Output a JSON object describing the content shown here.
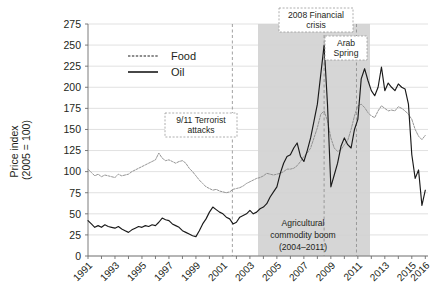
{
  "chart_data": {
    "type": "line",
    "title": "",
    "xlabel": "",
    "ylabel": "Price index\n(2005 = 100)",
    "ylabel_line1": "Price index",
    "ylabel_line2": "(2005 = 100)",
    "ylim": [
      0,
      275
    ],
    "yticks": [
      0,
      25,
      50,
      75,
      100,
      125,
      150,
      175,
      200,
      225,
      250,
      275
    ],
    "xlim": [
      1991,
      2016.2
    ],
    "xticks": [
      1991,
      1993,
      1995,
      1997,
      1999,
      2001,
      2003,
      2005,
      2007,
      2009,
      2011,
      2013,
      2015,
      2016
    ],
    "xticklabels": [
      "1991",
      "1993",
      "1995",
      "1997",
      "1999",
      "2001",
      "2003",
      "2005",
      "2007",
      "2009",
      "2011",
      "2013",
      "2015",
      "2016"
    ],
    "grid": true,
    "legend_position": "upper-left-inside",
    "legend": [
      {
        "name": "Food",
        "style": "dotted",
        "color": "#8e8e8e"
      },
      {
        "name": "Oil",
        "style": "solid",
        "color": "#1a1a1a"
      }
    ],
    "annotations": [
      {
        "label": "9/11 Terrorist\nattacks",
        "line1": "9/11 Terrorist",
        "line2": "attacks",
        "x": 2001.7,
        "boxed": true
      },
      {
        "label": "2008 Financial\ncrisis",
        "line1": "2008 Financial",
        "line2": "crisis",
        "x": 2008.5,
        "boxed": true
      },
      {
        "label": "Arab\nSpring",
        "line1": "Arab",
        "line2": "Spring",
        "x": 2010.9,
        "boxed": true
      },
      {
        "label": "Agricultural\ncommodity boom\n(2004–2011)",
        "line1": "Agricultural",
        "line2": "commodity boom",
        "line3": "(2004–2011)",
        "boxed": false
      }
    ],
    "shaded_region": {
      "label": "Agricultural commodity boom",
      "start": 2003.6,
      "end": 2011.9,
      "color": "#cfcfcf"
    },
    "vertical_markers": [
      2001.7,
      2008.5,
      2010.9
    ],
    "series": [
      {
        "name": "Food",
        "color": "#8e8e8e",
        "style": "dotted",
        "x": [
          1991.0,
          1991.25,
          1991.5,
          1991.75,
          1992.0,
          1992.25,
          1992.5,
          1992.75,
          1993.0,
          1993.25,
          1993.5,
          1993.75,
          1994.0,
          1994.25,
          1994.5,
          1994.75,
          1995.0,
          1995.25,
          1995.5,
          1995.75,
          1996.0,
          1996.25,
          1996.5,
          1996.75,
          1997.0,
          1997.25,
          1997.5,
          1997.75,
          1998.0,
          1998.25,
          1998.5,
          1998.75,
          1999.0,
          1999.25,
          1999.5,
          1999.75,
          2000.0,
          2000.25,
          2000.5,
          2000.75,
          2001.0,
          2001.25,
          2001.5,
          2001.75,
          2002.0,
          2002.25,
          2002.5,
          2002.75,
          2003.0,
          2003.25,
          2003.5,
          2003.75,
          2004.0,
          2004.25,
          2004.5,
          2004.75,
          2005.0,
          2005.25,
          2005.5,
          2005.75,
          2006.0,
          2006.25,
          2006.5,
          2006.75,
          2007.0,
          2007.25,
          2007.5,
          2007.75,
          2008.0,
          2008.25,
          2008.5,
          2008.75,
          2009.0,
          2009.25,
          2009.5,
          2009.75,
          2010.0,
          2010.25,
          2010.5,
          2010.75,
          2011.0,
          2011.25,
          2011.5,
          2011.75,
          2012.0,
          2012.25,
          2012.5,
          2012.75,
          2013.0,
          2013.25,
          2013.5,
          2013.75,
          2014.0,
          2014.25,
          2014.5,
          2014.75,
          2015.0,
          2015.25,
          2015.5,
          2015.75,
          2016.0
        ],
        "y": [
          103,
          99,
          95,
          97,
          94,
          96,
          95,
          94,
          93,
          97,
          95,
          96,
          97,
          100,
          102,
          104,
          106,
          108,
          110,
          112,
          114,
          122,
          116,
          113,
          114,
          112,
          110,
          112,
          113,
          110,
          104,
          100,
          95,
          90,
          86,
          82,
          80,
          78,
          79,
          77,
          76,
          75,
          76,
          79,
          80,
          81,
          83,
          86,
          88,
          90,
          92,
          93,
          95,
          98,
          97,
          96,
          97,
          98,
          100,
          103,
          103,
          104,
          107,
          112,
          118,
          122,
          128,
          140,
          152,
          168,
          172,
          160,
          140,
          128,
          124,
          126,
          132,
          137,
          150,
          166,
          178,
          180,
          176,
          170,
          166,
          164,
          172,
          178,
          175,
          172,
          173,
          172,
          177,
          175,
          172,
          168,
          162,
          150,
          142,
          138,
          143
        ]
      },
      {
        "name": "Oil",
        "color": "#1a1a1a",
        "style": "solid",
        "x": [
          1991.0,
          1991.25,
          1991.5,
          1991.75,
          1992.0,
          1992.25,
          1992.5,
          1992.75,
          1993.0,
          1993.25,
          1993.5,
          1993.75,
          1994.0,
          1994.25,
          1994.5,
          1994.75,
          1995.0,
          1995.25,
          1995.5,
          1995.75,
          1996.0,
          1996.25,
          1996.5,
          1996.75,
          1997.0,
          1997.25,
          1997.5,
          1997.75,
          1998.0,
          1998.25,
          1998.5,
          1998.75,
          1999.0,
          1999.25,
          1999.5,
          1999.75,
          2000.0,
          2000.25,
          2000.5,
          2000.75,
          2001.0,
          2001.25,
          2001.5,
          2001.75,
          2002.0,
          2002.25,
          2002.5,
          2002.75,
          2003.0,
          2003.25,
          2003.5,
          2003.75,
          2004.0,
          2004.25,
          2004.5,
          2004.75,
          2005.0,
          2005.25,
          2005.5,
          2005.75,
          2006.0,
          2006.25,
          2006.5,
          2006.75,
          2007.0,
          2007.25,
          2007.5,
          2007.75,
          2008.0,
          2008.25,
          2008.5,
          2008.75,
          2009.0,
          2009.25,
          2009.5,
          2009.75,
          2010.0,
          2010.25,
          2010.5,
          2010.75,
          2011.0,
          2011.25,
          2011.5,
          2011.75,
          2012.0,
          2012.25,
          2012.5,
          2012.75,
          2013.0,
          2013.25,
          2013.5,
          2013.75,
          2014.0,
          2014.25,
          2014.5,
          2014.75,
          2015.0,
          2015.25,
          2015.5,
          2015.75,
          2016.0
        ],
        "y": [
          42,
          38,
          34,
          36,
          34,
          37,
          35,
          34,
          33,
          35,
          32,
          30,
          28,
          31,
          33,
          35,
          34,
          36,
          35,
          37,
          36,
          40,
          45,
          43,
          42,
          38,
          36,
          34,
          30,
          28,
          26,
          24,
          23,
          30,
          38,
          44,
          52,
          58,
          55,
          52,
          50,
          46,
          44,
          38,
          40,
          46,
          48,
          50,
          54,
          50,
          52,
          56,
          58,
          62,
          70,
          76,
          82,
          98,
          110,
          118,
          120,
          128,
          134,
          118,
          112,
          125,
          140,
          160,
          180,
          215,
          250,
          180,
          82,
          96,
          110,
          130,
          140,
          132,
          128,
          150,
          162,
          210,
          222,
          208,
          196,
          190,
          200,
          224,
          196,
          205,
          200,
          196,
          204,
          200,
          198,
          180,
          120,
          92,
          102,
          60,
          78
        ]
      }
    ]
  },
  "axis": {
    "ylabel_line1": "Price index",
    "ylabel_line2": "(2005 = 100)"
  },
  "legend": {
    "food_label": "Food",
    "oil_label": "Oil"
  },
  "annotations": {
    "nine_eleven_line1": "9/11 Terrorist",
    "nine_eleven_line2": "attacks",
    "crisis_line1": "2008 Financial",
    "crisis_line2": "crisis",
    "arab_line1": "Arab",
    "arab_line2": "Spring",
    "boom_line1": "Agricultural",
    "boom_line2": "commodity boom",
    "boom_line3": "(2004–2011)"
  }
}
